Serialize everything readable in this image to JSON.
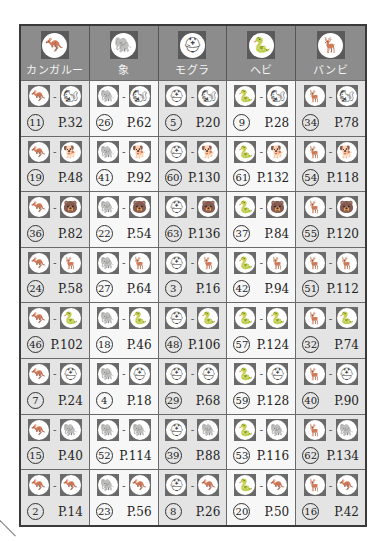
{
  "icons": {
    "kangaroo": "🦘",
    "elephant": "🐘",
    "mole": "⛑",
    "snake": "🐍",
    "bambi": "🦌",
    "squirrel": "🐿",
    "puppy": "🐕",
    "bear": "🐻"
  },
  "header": [
    {
      "label": "カンガルー",
      "icon": "🦘"
    },
    {
      "label": "象",
      "icon": "🐘"
    },
    {
      "label": "モグラ",
      "icon": "⛑"
    },
    {
      "label": "ヘビ",
      "icon": "🐍"
    },
    {
      "label": "バンビ",
      "icon": "🦌"
    }
  ],
  "rows": [
    {
      "partner_icon": "🐿",
      "cells": [
        {
          "num": "11",
          "page": "P.32"
        },
        {
          "num": "26",
          "page": "P.62"
        },
        {
          "num": "5",
          "page": "P.20"
        },
        {
          "num": "9",
          "page": "P.28"
        },
        {
          "num": "34",
          "page": "P.78"
        }
      ]
    },
    {
      "partner_icon": "🐕",
      "cells": [
        {
          "num": "19",
          "page": "P.48"
        },
        {
          "num": "41",
          "page": "P.92"
        },
        {
          "num": "60",
          "page": "P.130"
        },
        {
          "num": "61",
          "page": "P.132"
        },
        {
          "num": "54",
          "page": "P.118"
        }
      ]
    },
    {
      "partner_icon": "🐻",
      "cells": [
        {
          "num": "36",
          "page": "P.82"
        },
        {
          "num": "22",
          "page": "P.54"
        },
        {
          "num": "63",
          "page": "P.136"
        },
        {
          "num": "37",
          "page": "P.84"
        },
        {
          "num": "55",
          "page": "P.120"
        }
      ]
    },
    {
      "partner_icon": "🦌",
      "cells": [
        {
          "num": "24",
          "page": "P.58"
        },
        {
          "num": "27",
          "page": "P.64"
        },
        {
          "num": "3",
          "page": "P.16"
        },
        {
          "num": "42",
          "page": "P.94"
        },
        {
          "num": "51",
          "page": "P.112"
        }
      ]
    },
    {
      "partner_icon": "🐍",
      "cells": [
        {
          "num": "46",
          "page": "P.102"
        },
        {
          "num": "18",
          "page": "P.46"
        },
        {
          "num": "48",
          "page": "P.106"
        },
        {
          "num": "57",
          "page": "P.124"
        },
        {
          "num": "32",
          "page": "P.74"
        }
      ]
    },
    {
      "partner_icon": "⛑",
      "cells": [
        {
          "num": "7",
          "page": "P.24"
        },
        {
          "num": "4",
          "page": "P.18"
        },
        {
          "num": "29",
          "page": "P.68"
        },
        {
          "num": "59",
          "page": "P.128"
        },
        {
          "num": "40",
          "page": "P.90"
        }
      ]
    },
    {
      "partner_icon": "🐘",
      "cells": [
        {
          "num": "15",
          "page": "P.40"
        },
        {
          "num": "52",
          "page": "P.114"
        },
        {
          "num": "39",
          "page": "P.88"
        },
        {
          "num": "53",
          "page": "P.116"
        },
        {
          "num": "62",
          "page": "P.134"
        }
      ]
    },
    {
      "partner_icon": "🦘",
      "cells": [
        {
          "num": "2",
          "page": "P.14"
        },
        {
          "num": "23",
          "page": "P.56"
        },
        {
          "num": "8",
          "page": "P.26"
        },
        {
          "num": "20",
          "page": "P.50"
        },
        {
          "num": "16",
          "page": "P.42"
        }
      ]
    }
  ],
  "separator": "-"
}
